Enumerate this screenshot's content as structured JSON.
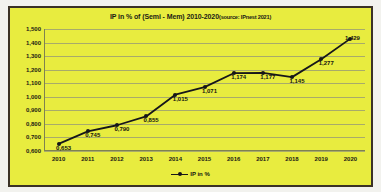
{
  "chart_data": {
    "type": "line",
    "title": "IP in % of (Semi - Mem) 2010-2020",
    "source_note": "(source: IPnest 2021)",
    "xlabel": "",
    "ylabel": "",
    "categories": [
      "2010",
      "2011",
      "2012",
      "2013",
      "2014",
      "2015",
      "2016",
      "2017",
      "2018",
      "2019",
      "2020"
    ],
    "values": [
      0.653,
      0.745,
      0.79,
      0.855,
      1.015,
      1.071,
      1.174,
      1.177,
      1.145,
      1.277,
      1.429
    ],
    "point_labels": [
      "0,653",
      "0,745",
      "0,790",
      "0,855",
      "1,015",
      "1,071",
      "1,174",
      "1,177",
      "1,145",
      "1,277",
      "1,429"
    ],
    "ytick_labels": [
      "1,500",
      "1,400",
      "1,300",
      "1,200",
      "1,100",
      "1,000",
      "0,900",
      "0,800",
      "0,700",
      "0,600"
    ],
    "ytick_values": [
      1.5,
      1.4,
      1.3,
      1.2,
      1.1,
      1.0,
      0.9,
      0.8,
      0.7,
      0.6
    ],
    "ylim": [
      0.6,
      1.5
    ],
    "grid": true,
    "legend": [
      "IP in %"
    ],
    "legend_position": "bottom",
    "series": [
      {
        "name": "IP in %",
        "values": [
          0.653,
          0.745,
          0.79,
          0.855,
          1.015,
          1.071,
          1.174,
          1.177,
          1.145,
          1.277,
          1.429
        ]
      }
    ],
    "colors": {
      "plot_background": "#e8ec3f",
      "frame_border": "#3b3226",
      "series_line": "#16161a",
      "gridline": "#a8ab6a",
      "text": "#1b1b14",
      "page_background": "#f2f2ee"
    }
  }
}
